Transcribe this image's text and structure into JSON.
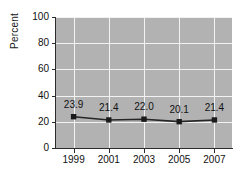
{
  "chart_data": {
    "type": "line",
    "title": "",
    "xlabel": "",
    "ylabel": "Percent",
    "categories": [
      "1999",
      "2001",
      "2003",
      "2005",
      "2007"
    ],
    "values": [
      23.9,
      21.4,
      22.0,
      20.1,
      21.4
    ],
    "data_labels": [
      "23.9",
      "21.4",
      "22.0",
      "20.1",
      "21.4"
    ],
    "ylim": [
      0,
      100
    ],
    "y_ticks": [
      "0",
      "20",
      "40",
      "60",
      "80",
      "100"
    ],
    "y_tick_values": [
      0,
      20,
      40,
      60,
      80,
      100
    ],
    "grid": "both",
    "legend": "none",
    "series": [
      {
        "name": "Percent",
        "values": [
          23.9,
          21.4,
          22.0,
          20.1,
          21.4
        ]
      }
    ],
    "colors": {
      "plot_background": "#b2b2b2",
      "gridline": "#f2f2f2",
      "line": "#262626",
      "marker": "#1a1a1a",
      "axis": "#2b2b2b",
      "text": "#111111",
      "page_background": "#ffffff"
    },
    "marker_shape": "square"
  }
}
